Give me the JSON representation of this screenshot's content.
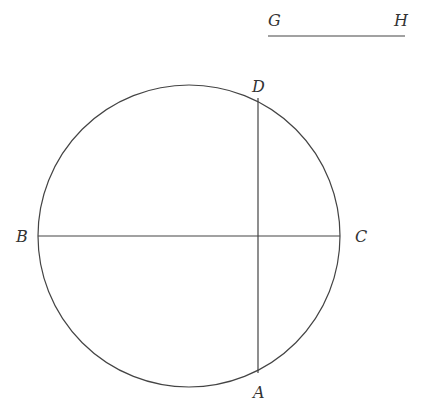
{
  "diagram": {
    "stroke_color": "#444444",
    "circle": {
      "cx": 189,
      "cy": 236,
      "r": 151
    },
    "segments": [
      {
        "id": "GH",
        "x1": 268,
        "y1": 36,
        "x2": 405,
        "y2": 36
      },
      {
        "id": "BC",
        "x1": 38,
        "y1": 236,
        "x2": 340,
        "y2": 236
      },
      {
        "id": "DA",
        "x1": 258,
        "y1": 98,
        "x2": 258,
        "y2": 373
      }
    ],
    "labels": [
      {
        "id": "G",
        "text": "G",
        "x": 268,
        "y": 26
      },
      {
        "id": "H",
        "text": "H",
        "x": 394,
        "y": 26
      },
      {
        "id": "D",
        "text": "D",
        "x": 252,
        "y": 92
      },
      {
        "id": "B",
        "text": "B",
        "x": 16,
        "y": 242
      },
      {
        "id": "C",
        "text": "C",
        "x": 355,
        "y": 242
      },
      {
        "id": "A",
        "text": "A",
        "x": 253,
        "y": 398
      }
    ]
  }
}
